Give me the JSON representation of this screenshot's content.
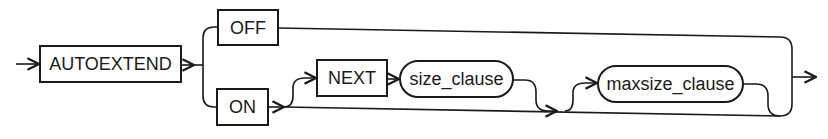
{
  "diagram": {
    "type": "syntax-railroad",
    "colors": {
      "stroke": "#1a1a1a",
      "background": "#ffffff"
    },
    "nodes": {
      "autoextend": {
        "label": "AUTOEXTEND",
        "kind": "keyword"
      },
      "off": {
        "label": "OFF",
        "kind": "keyword"
      },
      "on": {
        "label": "ON",
        "kind": "keyword"
      },
      "next": {
        "label": "NEXT",
        "kind": "keyword"
      },
      "size_clause": {
        "label": "size_clause",
        "kind": "clause"
      },
      "maxsize_clause": {
        "label": "maxsize_clause",
        "kind": "clause"
      }
    },
    "edges": [
      [
        "start",
        "AUTOEXTEND"
      ],
      [
        "AUTOEXTEND",
        "OFF"
      ],
      [
        "AUTOEXTEND",
        "ON"
      ],
      [
        "OFF",
        "end"
      ],
      [
        "ON",
        "NEXT"
      ],
      [
        "NEXT",
        "size_clause"
      ],
      [
        "ON",
        "maxsize_clause"
      ],
      [
        "size_clause",
        "maxsize_clause"
      ],
      [
        "maxsize_clause",
        "end"
      ],
      [
        "ON",
        "end"
      ]
    ]
  }
}
